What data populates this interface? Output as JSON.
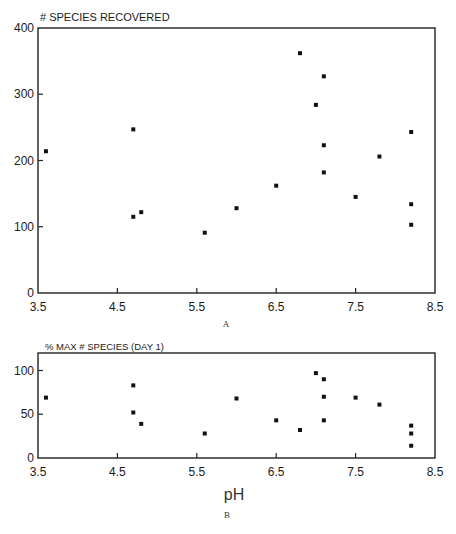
{
  "chart_data": [
    {
      "type": "scatter",
      "panel": "A",
      "title": "# SPECIES RECOVERED",
      "xlabel": "",
      "ylabel": "# SPECIES RECOVERED",
      "xlim": [
        3.5,
        8.5
      ],
      "ylim": [
        0,
        400
      ],
      "xticks": [
        "3.5",
        "4.5",
        "5.5",
        "6.5",
        "7.5",
        "8.5"
      ],
      "yticks": [
        "0",
        "100",
        "200",
        "300",
        "400"
      ],
      "grid": false,
      "legend": null,
      "points": [
        {
          "x": 3.6,
          "y": 214
        },
        {
          "x": 4.7,
          "y": 247
        },
        {
          "x": 4.7,
          "y": 115
        },
        {
          "x": 4.8,
          "y": 122
        },
        {
          "x": 5.6,
          "y": 91
        },
        {
          "x": 6.0,
          "y": 128
        },
        {
          "x": 6.5,
          "y": 162
        },
        {
          "x": 6.8,
          "y": 362
        },
        {
          "x": 7.0,
          "y": 284
        },
        {
          "x": 7.1,
          "y": 327
        },
        {
          "x": 7.1,
          "y": 223
        },
        {
          "x": 7.1,
          "y": 182
        },
        {
          "x": 7.5,
          "y": 145
        },
        {
          "x": 7.8,
          "y": 206
        },
        {
          "x": 8.2,
          "y": 243
        },
        {
          "x": 8.2,
          "y": 134
        },
        {
          "x": 8.2,
          "y": 103
        }
      ]
    },
    {
      "type": "scatter",
      "panel": "B",
      "title": "% MAX # SPECIES  (DAY 1)",
      "xlabel": "pH",
      "ylabel": "% MAX # SPECIES (DAY 1)",
      "xlim": [
        3.5,
        8.5
      ],
      "ylim": [
        0,
        120
      ],
      "xticks": [
        "3.5",
        "4.5",
        "5.5",
        "6.5",
        "7.5",
        "8.5"
      ],
      "yticks": [
        "0",
        "50",
        "100"
      ],
      "grid": false,
      "legend": null,
      "points": [
        {
          "x": 3.6,
          "y": 69
        },
        {
          "x": 4.7,
          "y": 83
        },
        {
          "x": 4.7,
          "y": 52
        },
        {
          "x": 4.8,
          "y": 39
        },
        {
          "x": 5.6,
          "y": 28
        },
        {
          "x": 6.0,
          "y": 68
        },
        {
          "x": 6.5,
          "y": 43
        },
        {
          "x": 6.8,
          "y": 32
        },
        {
          "x": 7.0,
          "y": 97
        },
        {
          "x": 7.1,
          "y": 90
        },
        {
          "x": 7.1,
          "y": 70
        },
        {
          "x": 7.1,
          "y": 43
        },
        {
          "x": 7.5,
          "y": 69
        },
        {
          "x": 7.8,
          "y": 61
        },
        {
          "x": 8.2,
          "y": 37
        },
        {
          "x": 8.2,
          "y": 28
        },
        {
          "x": 8.2,
          "y": 14
        }
      ]
    }
  ],
  "labels": {
    "chart_a_title": "# SPECIES RECOVERED",
    "chart_a_letter": "A",
    "chart_b_title": "% MAX # SPECIES  (DAY 1)",
    "chart_b_letter": "B",
    "x_axis_label": "pH"
  }
}
